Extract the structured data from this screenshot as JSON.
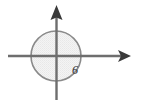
{
  "figure": {
    "type": "math-diagram",
    "background_color": "#ffffff",
    "width": 142,
    "height": 106,
    "origin": {
      "x": 56.5,
      "y": 56
    },
    "axes": {
      "x_axis": {
        "name": "x-axis",
        "start_x": 8,
        "end_x": 131,
        "y": 56,
        "color": "#6e6e6e",
        "stroke_width": 2.4,
        "arrow": {
          "direction": "right",
          "tip_x": 131,
          "tip_y": 56,
          "length": 13,
          "half_width": 6,
          "color": "#3a3a3a"
        }
      },
      "y_axis": {
        "name": "y-axis",
        "x": 56.5,
        "start_y": 100,
        "end_y": 5,
        "color": "#6e6e6e",
        "stroke_width": 2.4,
        "arrow": {
          "direction": "up",
          "tip_x": 56.5,
          "tip_y": 5,
          "length": 15,
          "half_width": 6,
          "color": "#3a3a3a"
        }
      }
    },
    "circle": {
      "name": "circle",
      "center_x": 56,
      "center_y": 56,
      "radius": 25,
      "radius_value": 6,
      "stroke_color": "#8a8a8a",
      "stroke_width": 1.6,
      "fill_color": "#f2f2f2",
      "fill_opacity": 0.85
    },
    "labels": [
      {
        "name": "radius-label",
        "text": "6",
        "x": 72,
        "y": 64,
        "color": "#2f2f2f",
        "font_size": 12,
        "style": "italic"
      }
    ]
  }
}
